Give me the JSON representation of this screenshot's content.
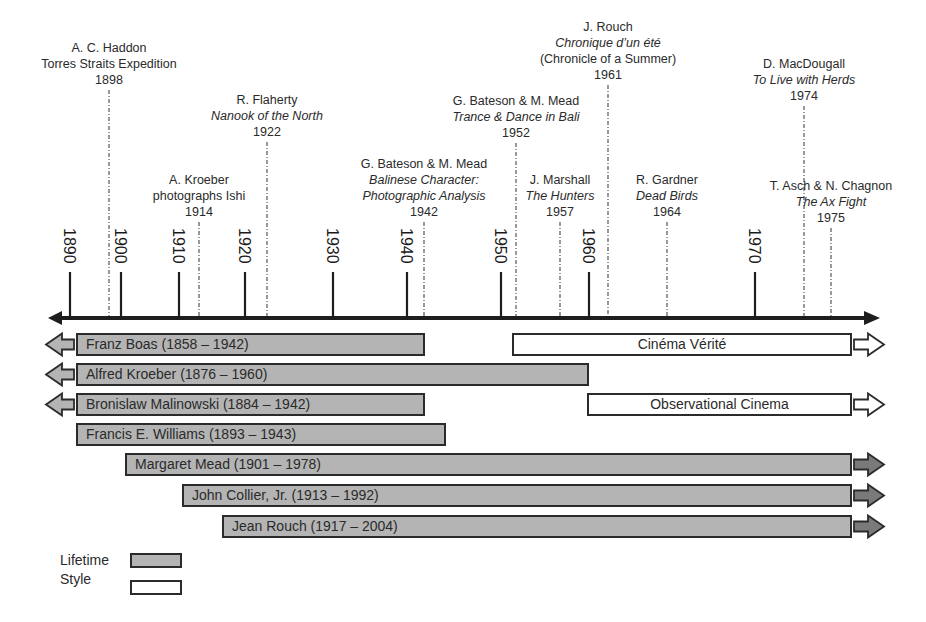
{
  "chart_data": {
    "type": "timeline",
    "title": "",
    "axis": {
      "ticks": [
        1890,
        1900,
        1910,
        1920,
        1930,
        1940,
        1950,
        1960,
        1970
      ],
      "tick_x": [
        70,
        121,
        179,
        245,
        333,
        407,
        501,
        589,
        755
      ],
      "arrows": "both"
    },
    "events": [
      {
        "year": 1898,
        "x": 109,
        "lines": [
          "A. C. Haddon",
          "Torres Straits Expedition"
        ],
        "italic": [
          false,
          false
        ],
        "label_top": 40
      },
      {
        "year": 1914,
        "x": 199,
        "lines": [
          "A. Kroeber",
          "photographs Ishi"
        ],
        "italic": [
          false,
          false
        ],
        "label_top": 172
      },
      {
        "year": 1922,
        "x": 267,
        "lines": [
          "R. Flaherty",
          "Nanook of the North"
        ],
        "italic": [
          false,
          true
        ],
        "label_top": 92
      },
      {
        "year": 1942,
        "x": 424,
        "lines": [
          "G. Bateson & M. Mead",
          "Balinese Character:",
          "Photographic Analysis"
        ],
        "italic": [
          false,
          true,
          true
        ],
        "label_top": 156
      },
      {
        "year": 1952,
        "x": 516,
        "lines": [
          "G. Bateson & M. Mead",
          "Trance & Dance in Bali"
        ],
        "italic": [
          false,
          true
        ],
        "label_top": 93
      },
      {
        "year": 1957,
        "x": 560,
        "lines": [
          "J. Marshall",
          "The Hunters"
        ],
        "italic": [
          false,
          true
        ],
        "label_top": 172
      },
      {
        "year": 1961,
        "x": 608,
        "lines": [
          "J. Rouch",
          "Chronique d’un été",
          "(Chronicle of a Summer)"
        ],
        "italic": [
          false,
          true,
          false
        ],
        "label_top": 19
      },
      {
        "year": 1964,
        "x": 667,
        "lines": [
          "R. Gardner",
          "Dead Birds"
        ],
        "italic": [
          false,
          true
        ],
        "label_top": 172
      },
      {
        "year": 1974,
        "x": 804,
        "lines": [
          "D. MacDougall",
          "To Live with Herds"
        ],
        "italic": [
          false,
          true
        ],
        "label_top": 56
      },
      {
        "year": 1975,
        "x": 831,
        "lines": [
          "T. Asch & N. Chagnon",
          "The Ax Fight"
        ],
        "italic": [
          false,
          true
        ],
        "label_top": 178
      }
    ],
    "lifetimes": [
      {
        "label": "Franz Boas  (1858 – 1942)",
        "name": "Franz Boas",
        "birth": 1858,
        "death": 1942,
        "x0": 76,
        "x1": 425,
        "y": 333,
        "arrow_left": true,
        "arrow_right": false
      },
      {
        "label": "Alfred Kroeber (1876 – 1960)",
        "name": "Alfred Kroeber",
        "birth": 1876,
        "death": 1960,
        "x0": 76,
        "x1": 589,
        "y": 363,
        "arrow_left": true,
        "arrow_right": false
      },
      {
        "label": "Bronislaw  Malinowski (1884 – 1942)",
        "name": "Bronislaw Malinowski",
        "birth": 1884,
        "death": 1942,
        "x0": 76,
        "x1": 425,
        "y": 393,
        "arrow_left": true,
        "arrow_right": false
      },
      {
        "label": "Francis E. Williams (1893 – 1943)",
        "name": "Francis E. Williams",
        "birth": 1893,
        "death": 1943,
        "x0": 76,
        "x1": 446,
        "y": 423,
        "arrow_left": false,
        "arrow_right": false
      },
      {
        "label": "Margaret Mead (1901 – 1978)",
        "name": "Margaret Mead",
        "birth": 1901,
        "death": 1978,
        "x0": 125,
        "x1": 852,
        "y": 453,
        "arrow_left": false,
        "arrow_right": true
      },
      {
        "label": "John Collier,  Jr. (1913 – 1992)",
        "name": "John Collier, Jr.",
        "birth": 1913,
        "death": 1992,
        "x0": 182,
        "x1": 852,
        "y": 484,
        "arrow_left": false,
        "arrow_right": true
      },
      {
        "label": "Jean Rouch (1917 – 2004)",
        "name": "Jean Rouch",
        "birth": 1917,
        "death": 2004,
        "x0": 222,
        "x1": 852,
        "y": 515,
        "arrow_left": false,
        "arrow_right": true
      }
    ],
    "styles": [
      {
        "label": "Cinéma Vérité",
        "start": 1952,
        "x0": 512,
        "x1": 852,
        "y": 333,
        "arrow_right": true
      },
      {
        "label": "Observational Cinema",
        "start": 1960,
        "x0": 587,
        "x1": 852,
        "y": 393,
        "arrow_right": true
      }
    ],
    "legend": [
      {
        "label": "Lifetime",
        "kind": "lifetime"
      },
      {
        "label": "Style",
        "kind": "style"
      }
    ],
    "colors": {
      "lifetime_fill": "#b4b4b4",
      "style_fill": "#ffffff",
      "stroke": "#2b2b2b",
      "axis": "#1e1e1e",
      "dash": "#555555",
      "arrow_fill": "#8a8a8a"
    }
  },
  "legend": {
    "lifetime_label": "Lifetime",
    "style_label": "Style"
  }
}
